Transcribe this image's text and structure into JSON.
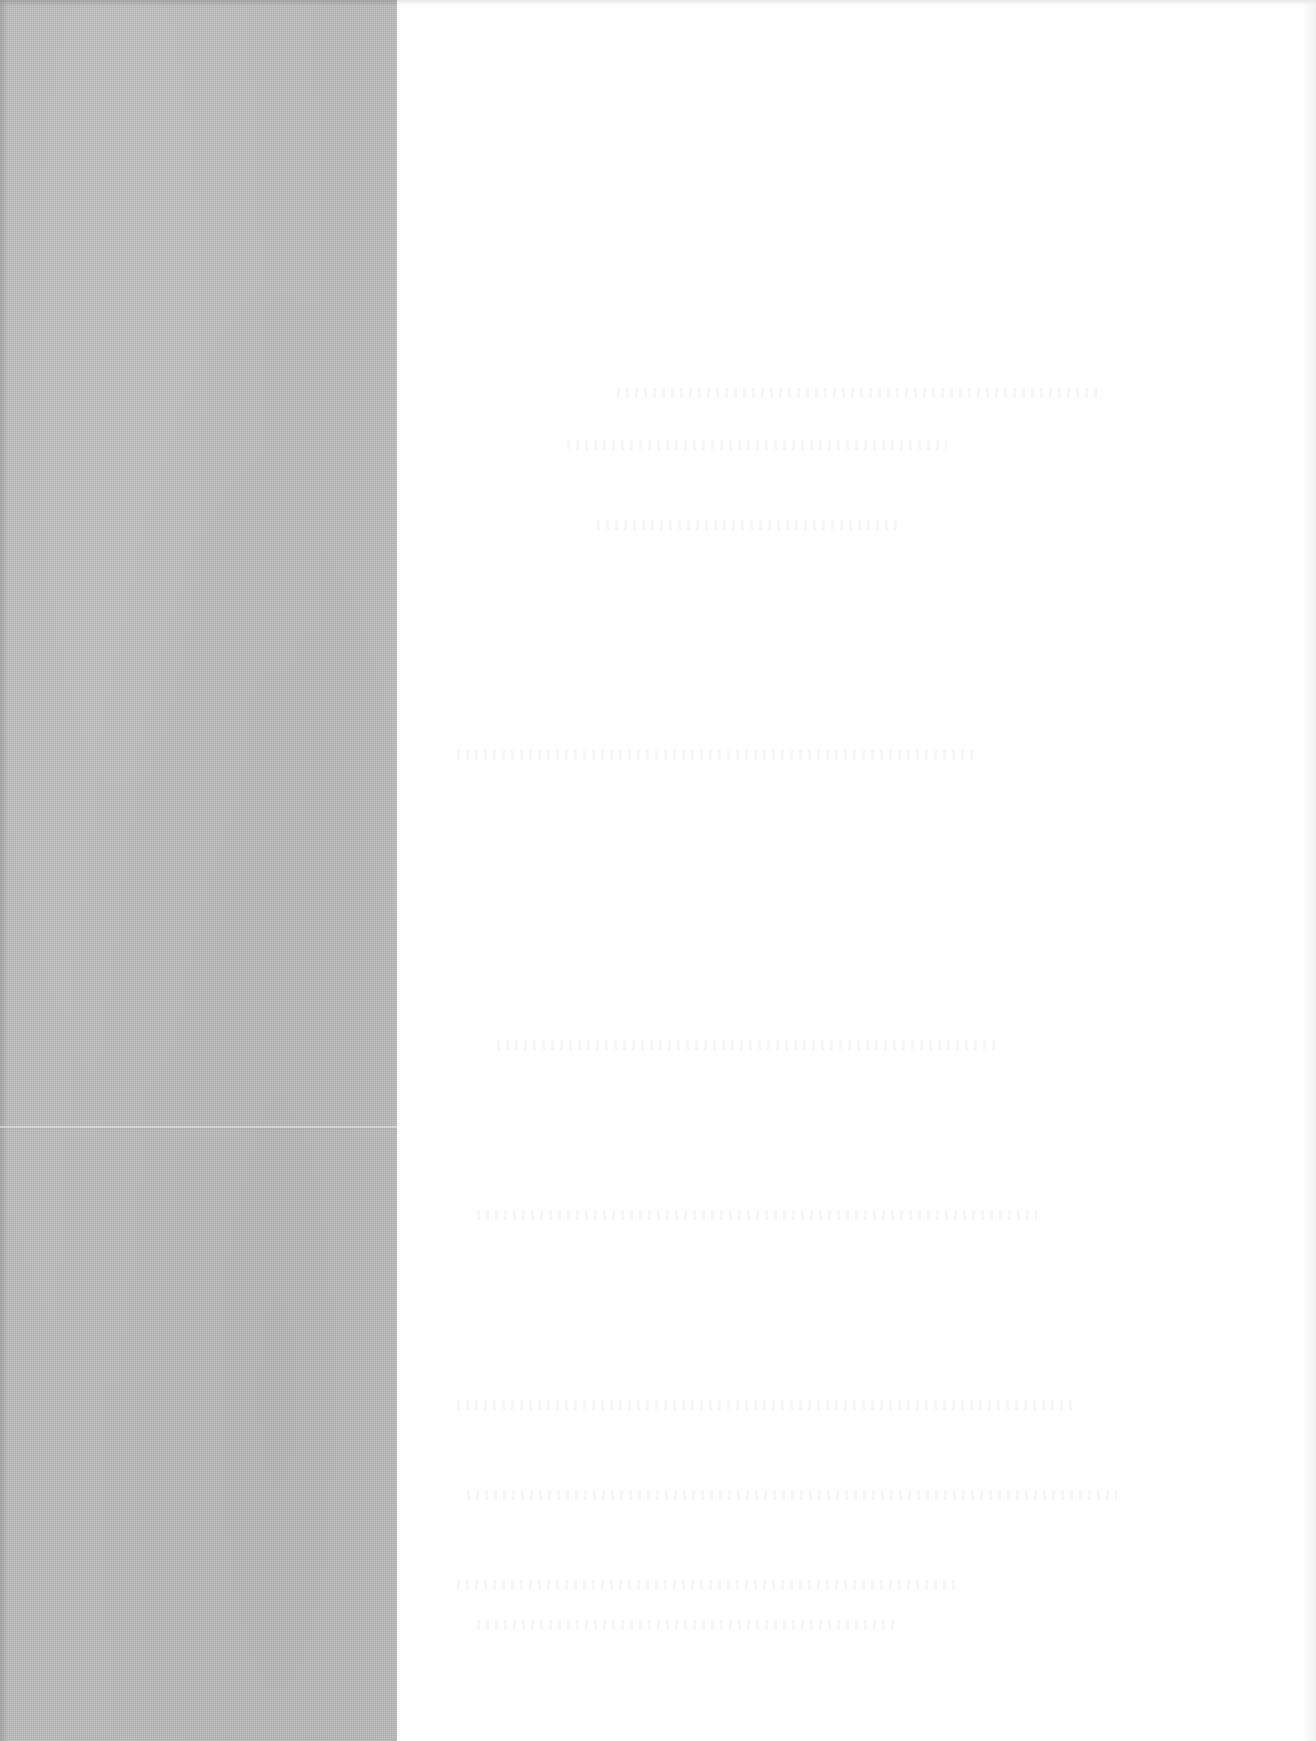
{
  "page": {
    "type": "scanned-blank-page",
    "width": 1316,
    "height": 1741,
    "legible_text": []
  },
  "regions": {
    "gray_strip": {
      "x": 0,
      "y": 0,
      "width": 397,
      "height": 1741,
      "color": "#bcbcbc"
    },
    "paper": {
      "x": 397,
      "y": 0,
      "width": 919,
      "height": 1741,
      "color": "#ffffff"
    },
    "fold_line": {
      "y": 1126
    }
  },
  "bleed_through_rows": [
    {
      "x": 220,
      "y": 388,
      "width": 480
    },
    {
      "x": 170,
      "y": 440,
      "width": 380
    },
    {
      "x": 200,
      "y": 520,
      "width": 300
    },
    {
      "x": 60,
      "y": 750,
      "width": 520
    },
    {
      "x": 100,
      "y": 1040,
      "width": 500
    },
    {
      "x": 80,
      "y": 1210,
      "width": 560
    },
    {
      "x": 60,
      "y": 1400,
      "width": 620
    },
    {
      "x": 70,
      "y": 1490,
      "width": 650
    },
    {
      "x": 60,
      "y": 1580,
      "width": 500
    },
    {
      "x": 80,
      "y": 1620,
      "width": 420
    }
  ]
}
